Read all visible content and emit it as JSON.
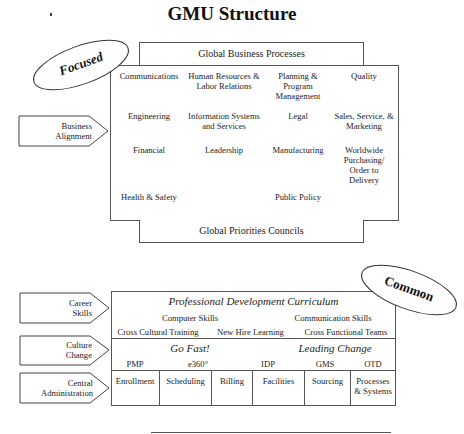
{
  "title": "GMU Structure",
  "focused_section": {
    "badge": "Focused",
    "top_bar": "Global Business Processes",
    "bottom_bar": "Global Priorities Councils",
    "arrow_label": [
      "Business",
      "Alignment"
    ],
    "grid": [
      [
        "Communications",
        "Human Resources & Labor Relations",
        "Planning & Program Management",
        "Quality"
      ],
      [
        "Engineering",
        "Information Systems and Services",
        "Legal",
        "Sales, Service, & Marketing"
      ],
      [
        "Financial",
        "Leadership",
        "Manufacturing",
        "Worldwide Purchasing/ Order to Delivery"
      ],
      [
        "Health & Safety",
        "",
        "Public Policy",
        ""
      ]
    ]
  },
  "common_section": {
    "badge": "Common",
    "arrows": [
      {
        "line1": "Career",
        "line2": "Skills"
      },
      {
        "line1": "Culture",
        "line2": "Change"
      },
      {
        "line1": "Central",
        "line2": "Administration"
      }
    ],
    "career": {
      "heading": "Professional Development Curriculum",
      "row1": [
        "Computer Skills",
        "Communication Skills"
      ],
      "row2": [
        "Cross Cultural Training",
        "New Hire Learning",
        "Cross Functional Teams"
      ]
    },
    "culture": {
      "headings": [
        "Go Fast!",
        "Leading Change"
      ],
      "items": [
        "PMP",
        "e360°",
        "IDP",
        "GMS",
        "OTD"
      ]
    },
    "admin": {
      "cells": [
        "Enrollment",
        "Scheduling",
        "Billing",
        "Facilities",
        "Sourcing",
        "Processes & Systems"
      ]
    }
  }
}
